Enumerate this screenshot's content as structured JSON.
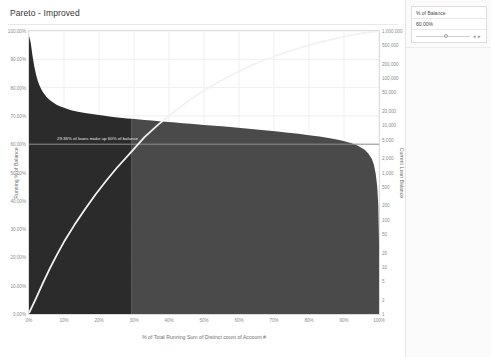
{
  "worksheet": {
    "title": "Pareto - Improved"
  },
  "parameter_panel": {
    "title": "% of Balance",
    "value": "60.00%",
    "decrease_label": "◂",
    "increase_label": "▸"
  },
  "chart_data": {
    "type": "area",
    "title": "Pareto - Improved",
    "xlabel": "% of Total Running Sum of Distinct count of Account #",
    "ylabel": "Running % of Balance",
    "y2label": "Current Loan Balance",
    "xlim": [
      0,
      100
    ],
    "ylim": [
      0,
      100
    ],
    "y2lim": [
      1,
      1000000
    ],
    "y2_scale": "log",
    "grid": true,
    "legend_position": "none",
    "xtick_labels": [
      "0%",
      "10%",
      "20%",
      "30%",
      "40%",
      "50%",
      "60%",
      "70%",
      "80%",
      "90%",
      "100%"
    ],
    "xtick_values": [
      0,
      10,
      20,
      30,
      40,
      50,
      60,
      70,
      80,
      90,
      100
    ],
    "ytick_labels": [
      "100.00%",
      "90.00%",
      "80.00%",
      "70.00%",
      "60.00%",
      "50.00%",
      "40.00%",
      "30.00%",
      "20.00%",
      "10.00%",
      "0.00%"
    ],
    "ytick_values": [
      100,
      90,
      80,
      70,
      60,
      50,
      40,
      30,
      20,
      10,
      0
    ],
    "y2tick_labels": [
      "1,000,000",
      "500,000",
      "200,000",
      "100,000",
      "50,000",
      "20,000",
      "10,000",
      "5,000",
      "2,000",
      "1,000",
      "500",
      "200",
      "100",
      "50",
      "20",
      "10",
      "5",
      "2",
      "1"
    ],
    "y2tick_values": [
      1000000,
      500000,
      200000,
      100000,
      50000,
      20000,
      10000,
      5000,
      2000,
      1000,
      500,
      200,
      100,
      50,
      20,
      10,
      5,
      2,
      1
    ],
    "annotation": {
      "text": "29.36% of loans make up 60% of balance",
      "x": 8.0,
      "y": 61.5
    },
    "reference_line": {
      "label": "60% of balance",
      "y": 60.0,
      "color": "#8f8f8f"
    },
    "split_x": 29.36,
    "colors": {
      "bars_below_threshold": "#2b2b2b",
      "bars_above_threshold": "#4a4a4a",
      "cumulative_line": "#f2f2f2",
      "axis_text": "#8c8c8c",
      "grid": "#efefef",
      "panel_background": "#fbfbfb"
    },
    "series": [
      {
        "name": "Current Loan Balance",
        "type": "area",
        "x": [
          0,
          0.5,
          1,
          1.5,
          2,
          2.5,
          3,
          3.5,
          4,
          5,
          6,
          7,
          8,
          9,
          10,
          12,
          14,
          16,
          18,
          20,
          22,
          24,
          26,
          28,
          29.36,
          31,
          33,
          35,
          38,
          41,
          44,
          47,
          50,
          53,
          56,
          59,
          62,
          65,
          68,
          71,
          74,
          77,
          80,
          83,
          86,
          89,
          92,
          94,
          96,
          97,
          98,
          98.6,
          99.1,
          99.5,
          99.8,
          100
        ],
        "y_loan_balance": [
          780000,
          560000,
          300000,
          180000,
          120000,
          88000,
          70000,
          58000,
          50000,
          40000,
          34000,
          30000,
          27000,
          25000,
          23500,
          21000,
          19500,
          18300,
          17300,
          16500,
          15800,
          15100,
          14500,
          14000,
          13800,
          13400,
          13000,
          12600,
          12100,
          11600,
          11100,
          10700,
          10200,
          9800,
          9400,
          9000,
          8600,
          8200,
          7800,
          7400,
          7000,
          6600,
          6200,
          5800,
          5300,
          4800,
          4200,
          3700,
          3000,
          2500,
          1900,
          1400,
          900,
          500,
          200,
          30
        ]
      },
      {
        "name": "Running % of Balance",
        "type": "line",
        "x": [
          0,
          2,
          4,
          6,
          8,
          10,
          13,
          16,
          19,
          22,
          25,
          29.36,
          33,
          37,
          41,
          45,
          50,
          55,
          60,
          65,
          70,
          75,
          80,
          85,
          90,
          95,
          100
        ],
        "y_running_pct": [
          0.3,
          5.5,
          11.0,
          16.2,
          21.0,
          25.5,
          31.5,
          37.0,
          42.2,
          47.0,
          51.5,
          57.5,
          62.5,
          67.0,
          71.0,
          74.8,
          79.0,
          82.6,
          85.8,
          88.6,
          91.0,
          93.2,
          95.0,
          96.6,
          98.0,
          99.2,
          100.0
        ]
      }
    ]
  }
}
